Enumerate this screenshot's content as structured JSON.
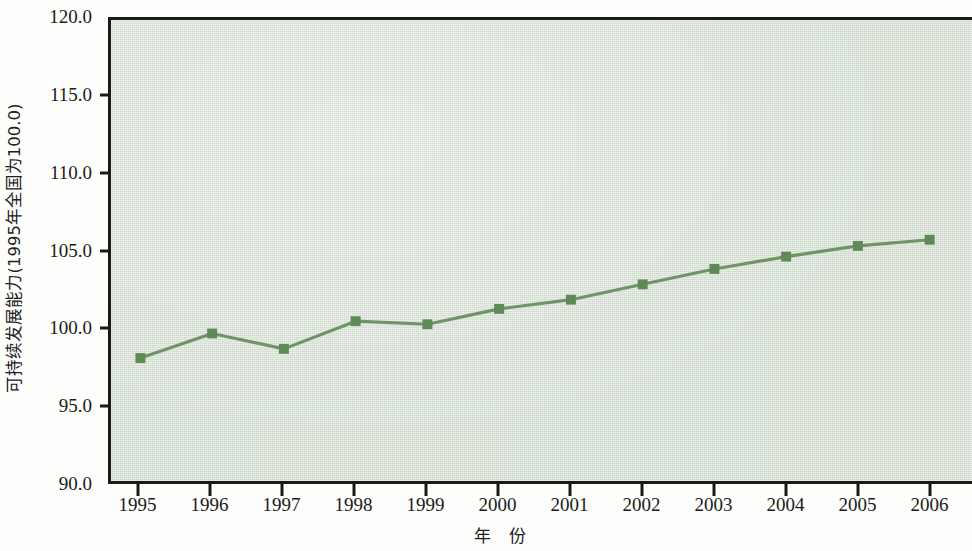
{
  "chart_data": {
    "type": "line",
    "title": "",
    "xlabel": "年 份",
    "ylabel": "可持续发展能力(1995年全国为100.0)",
    "categories": [
      "1995",
      "1996",
      "1997",
      "1998",
      "1999",
      "2000",
      "2001",
      "2002",
      "2003",
      "2004",
      "2005",
      "2006"
    ],
    "x": [
      1995,
      1996,
      1997,
      1998,
      1999,
      2000,
      2001,
      2002,
      2003,
      2004,
      2005,
      2006
    ],
    "values": [
      98.0,
      99.6,
      98.6,
      100.4,
      100.2,
      101.2,
      101.8,
      102.8,
      103.8,
      104.6,
      105.3,
      105.7
    ],
    "series": [
      {
        "name": "可持续发展能力",
        "values": [
          98.0,
          99.6,
          98.6,
          100.4,
          100.2,
          101.2,
          101.8,
          102.8,
          103.8,
          104.6,
          105.3,
          105.7
        ]
      }
    ],
    "ylim": [
      90.0,
      120.0
    ],
    "y_ticks": [
      120.0,
      115.0,
      110.0,
      105.0,
      100.0,
      95.0,
      90.0
    ],
    "y_tick_labels": [
      "120.0",
      "115.0",
      "110.0",
      "105.0",
      "100.0",
      "95.0",
      "90.0"
    ],
    "grid": false,
    "legend": "none",
    "marker": "square",
    "colors": {
      "line": "#6f9467",
      "marker": "#5f8a57",
      "plot_background": "#d6e0d4",
      "axis": "#1a1a18",
      "text": "#1b1b19"
    }
  }
}
